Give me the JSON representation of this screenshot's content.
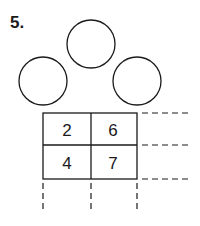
{
  "problem": {
    "number_label": "5.",
    "circles": [
      {
        "name": "top",
        "value": ""
      },
      {
        "name": "left",
        "value": ""
      },
      {
        "name": "right",
        "value": ""
      }
    ],
    "grid": {
      "rows": [
        [
          "2",
          "6"
        ],
        [
          "4",
          "7"
        ]
      ]
    }
  }
}
